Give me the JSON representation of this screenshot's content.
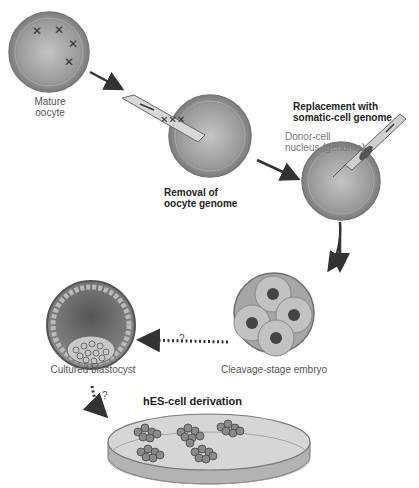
{
  "diagram": {
    "steps": [
      {
        "id": "mature-oocyte",
        "label_line1": "Mature",
        "label_line2": "oocyte"
      },
      {
        "id": "removal",
        "label_line1": "Removal of",
        "label_line2": "oocyte genome"
      },
      {
        "id": "replacement",
        "label_line1": "Replacement with",
        "label_line2": "somatic-cell genome",
        "sublabel_line1": "Donor-cell",
        "sublabel_line2": "nucleus (genome)"
      },
      {
        "id": "cleavage",
        "label": "Cleavage-stage embryo"
      },
      {
        "id": "blastocyst",
        "label": "Cultured blastocyst"
      },
      {
        "id": "hes",
        "label": "hES-cell derivation"
      }
    ],
    "uncertain_marks": [
      "?",
      "?"
    ],
    "colors": {
      "cell": "#8a8a8a",
      "cell_light": "#b8b8b8",
      "arrow": "#3a3a3a",
      "text": "#555555"
    }
  }
}
